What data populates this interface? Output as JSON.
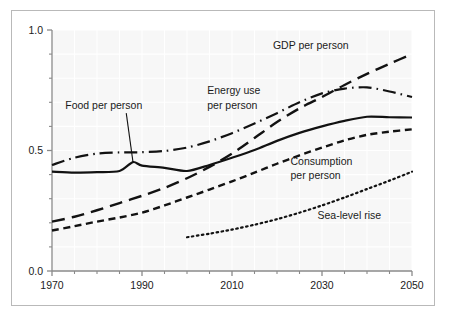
{
  "chart_data": {
    "type": "line",
    "title": "",
    "subtitle": "",
    "xlabel": "",
    "ylabel": "",
    "xlim": [
      1970,
      2050
    ],
    "ylim": [
      0.0,
      1.0
    ],
    "grid": true,
    "legend_position": "inline-annotations",
    "x_ticks_major": [
      1970,
      1990,
      2010,
      2030,
      2050
    ],
    "x_tick_labels": [
      "1970",
      "1990",
      "2010",
      "2030",
      "2050"
    ],
    "x_ticks_minor": [
      1975,
      1980,
      1985,
      1995,
      2000,
      2005,
      2015,
      2020,
      2025,
      2035,
      2040,
      2045
    ],
    "y_ticks_major": [
      0.0,
      0.5,
      1.0
    ],
    "y_tick_labels": [
      "0.0",
      "0.5",
      "1.0"
    ],
    "y_ticks_minor": [
      0.1,
      0.2,
      0.3,
      0.4,
      0.6,
      0.7,
      0.8,
      0.9
    ],
    "series": [
      {
        "name": "GDP per person",
        "style": "long-dash",
        "label": "GDP per person",
        "label_x": 2027.5,
        "label_y": 0.935,
        "x": [
          1970,
          1975,
          1980,
          1985,
          1990,
          1995,
          2000,
          2005,
          2010,
          2015,
          2020,
          2025,
          2030,
          2035,
          2040,
          2045,
          2050
        ],
        "y": [
          0.205,
          0.225,
          0.252,
          0.282,
          0.312,
          0.345,
          0.385,
          0.432,
          0.487,
          0.552,
          0.618,
          0.675,
          0.722,
          0.772,
          0.818,
          0.86,
          0.9
        ]
      },
      {
        "name": "Energy use per person",
        "style": "dash-dot",
        "label": "Energy use\nper person",
        "label_x": 2004.5,
        "label_y": 0.748,
        "label_line2_y": 0.688,
        "x": [
          1970,
          1975,
          1980,
          1985,
          1990,
          1995,
          2000,
          2005,
          2010,
          2015,
          2020,
          2025,
          2030,
          2035,
          2040,
          2045,
          2050
        ],
        "y": [
          0.44,
          0.47,
          0.487,
          0.492,
          0.493,
          0.498,
          0.512,
          0.538,
          0.572,
          0.612,
          0.655,
          0.7,
          0.737,
          0.757,
          0.762,
          0.745,
          0.722
        ]
      },
      {
        "name": "Food per person",
        "style": "solid",
        "label": "Food per person",
        "label_x": 1981.5,
        "label_y": 0.688,
        "leader_from_x": 1986.5,
        "leader_from_y": 0.655,
        "leader_to_x": 1988.0,
        "leader_to_y": 0.452,
        "x": [
          1970,
          1975,
          1980,
          1985,
          1988,
          1990,
          1995,
          2000,
          2005,
          2010,
          2015,
          2020,
          2025,
          2030,
          2035,
          2040,
          2045,
          2050
        ],
        "y": [
          0.412,
          0.408,
          0.41,
          0.415,
          0.452,
          0.437,
          0.428,
          0.415,
          0.44,
          0.47,
          0.502,
          0.54,
          0.573,
          0.6,
          0.623,
          0.64,
          0.638,
          0.637
        ]
      },
      {
        "name": "Consumption per person",
        "style": "short-dash",
        "label": "Consumption\nper person",
        "label_x": 2023.0,
        "label_y": 0.455,
        "label_line2_y": 0.395,
        "x": [
          1970,
          1975,
          1980,
          1985,
          1990,
          1995,
          2000,
          2005,
          2010,
          2015,
          2020,
          2025,
          2030,
          2035,
          2040,
          2045,
          2050
        ],
        "y": [
          0.168,
          0.186,
          0.205,
          0.222,
          0.242,
          0.272,
          0.305,
          0.338,
          0.372,
          0.408,
          0.445,
          0.48,
          0.512,
          0.542,
          0.565,
          0.578,
          0.588
        ]
      },
      {
        "name": "Sea-level rise",
        "style": "dotted",
        "label": "Sea-level rise",
        "label_x": 2029.0,
        "label_y": 0.232,
        "x": [
          2000,
          2005,
          2010,
          2015,
          2020,
          2025,
          2030,
          2035,
          2040,
          2045,
          2050
        ],
        "y": [
          0.14,
          0.155,
          0.172,
          0.192,
          0.215,
          0.242,
          0.272,
          0.305,
          0.34,
          0.375,
          0.412
        ]
      }
    ]
  },
  "style_colors": {
    "line": "#121212",
    "plot_background": "#f7f7f7",
    "grid": "#ffffff",
    "axis": "#8a8a8a",
    "frame": "#b9b9b9",
    "text": "#1b1b1b"
  }
}
